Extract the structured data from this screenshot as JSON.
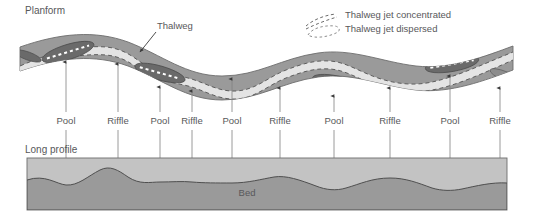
{
  "figure": {
    "background_color": "#ffffff",
    "text_color": "#58585a"
  },
  "planform": {
    "title": "Planform",
    "thalweg_label": "Thalweg",
    "channel_fill": "#9a9a9a",
    "channel_outline": "#6d6d6d",
    "thalweg_fill": "#e3e3e3",
    "pool_fill": "#6a6a6a",
    "jet_dash_color": "#5d5d5d"
  },
  "legend": {
    "items": [
      {
        "label": "Thalweg jet concentrated",
        "style": "dashed-curve-open",
        "color": "#6b6b6b"
      },
      {
        "label": "Thalweg jet dispersed",
        "style": "dashed-curve-closed",
        "color": "#8e8e8e"
      }
    ]
  },
  "long_profile": {
    "title": "Long profile",
    "bed_label": "Bed",
    "water_fill": "#c3c3c3",
    "bed_fill": "#9a9a9a",
    "outline": "#6d6d6d"
  },
  "features": {
    "labels": [
      {
        "name": "Pool",
        "x": 66,
        "kind": "pool"
      },
      {
        "name": "Riffle",
        "x": 118,
        "kind": "riffle"
      },
      {
        "name": "Pool",
        "x": 160,
        "kind": "pool"
      },
      {
        "name": "Riffle",
        "x": 192,
        "kind": "riffle"
      },
      {
        "name": "Pool",
        "x": 232,
        "kind": "pool"
      },
      {
        "name": "Riffle",
        "x": 280,
        "kind": "riffle"
      },
      {
        "name": "Pool",
        "x": 334,
        "kind": "pool"
      },
      {
        "name": "Riffle",
        "x": 390,
        "kind": "riffle"
      },
      {
        "name": "Pool",
        "x": 450,
        "kind": "pool"
      },
      {
        "name": "Riffle",
        "x": 500,
        "kind": "riffle"
      }
    ],
    "label_row_y": 121,
    "upper_arrow_top_y": 62,
    "upper_arrow_bottom_y": 112,
    "lower_arrow_top_y": 130,
    "lower_arrow_bottom_y": 190
  },
  "arrow_targets": {
    "planform_tips_y": [
      62,
      64,
      71,
      74,
      72,
      76,
      66,
      72,
      62,
      70
    ],
    "bed_tips_y": [
      184,
      170,
      181,
      181,
      182,
      177,
      188,
      178,
      190,
      182
    ]
  }
}
